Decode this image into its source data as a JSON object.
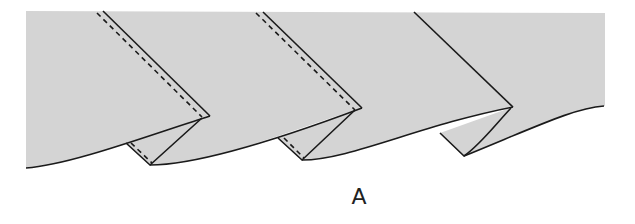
{
  "figure": {
    "label": "A",
    "colors": {
      "fabric": "#d4d4d4",
      "outline": "#1a1a1a",
      "background": "#ffffff"
    },
    "pleats": [
      {
        "id": 1,
        "has_stitching": true
      },
      {
        "id": 2,
        "has_stitching": true
      },
      {
        "id": 3,
        "has_stitching": false
      }
    ]
  }
}
